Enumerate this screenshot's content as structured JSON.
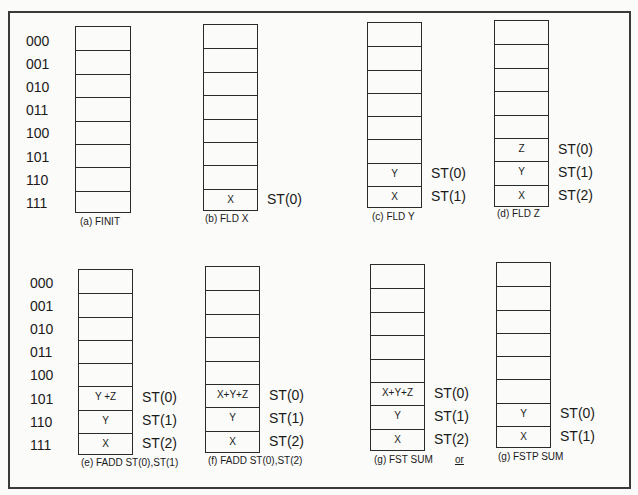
{
  "address_labels": {
    "top": [
      "000",
      "001",
      "010",
      "011",
      "100",
      "101",
      "110",
      "111"
    ],
    "bottom": [
      "000",
      "001",
      "010",
      "011",
      "100",
      "101",
      "110",
      "111"
    ]
  },
  "stacks": [
    {
      "id": "a",
      "caption": "(a) FINIT",
      "cells": [
        "",
        "",
        "",
        "",
        "",
        "",
        "",
        ""
      ],
      "st_labels": [
        "",
        "",
        "",
        "",
        "",
        "",
        "",
        ""
      ]
    },
    {
      "id": "b",
      "caption": "(b) FLD X",
      "cells": [
        "",
        "",
        "",
        "",
        "",
        "",
        "",
        "X"
      ],
      "st_labels": [
        "",
        "",
        "",
        "",
        "",
        "",
        "",
        "ST(0)"
      ]
    },
    {
      "id": "c",
      "caption": "(c) FLD Y",
      "cells": [
        "",
        "",
        "",
        "",
        "",
        "",
        "Y",
        "X"
      ],
      "st_labels": [
        "",
        "",
        "",
        "",
        "",
        "",
        "ST(0)",
        "ST(1)"
      ]
    },
    {
      "id": "d",
      "caption": "(d) FLD Z",
      "cells": [
        "",
        "",
        "",
        "",
        "",
        "Z",
        "Y",
        "X"
      ],
      "st_labels": [
        "",
        "",
        "",
        "",
        "",
        "ST(0)",
        "ST(1)",
        "ST(2)"
      ]
    },
    {
      "id": "e",
      "caption": "(e) FADD ST(0),ST(1)",
      "cells": [
        "",
        "",
        "",
        "",
        "",
        "Y +Z",
        "Y",
        "X"
      ],
      "st_labels": [
        "",
        "",
        "",
        "",
        "",
        "ST(0)",
        "ST(1)",
        "ST(2)"
      ]
    },
    {
      "id": "f",
      "caption": "(f) FADD ST(0),ST(2)",
      "cells": [
        "",
        "",
        "",
        "",
        "",
        "X+Y+Z",
        "Y",
        "X"
      ],
      "st_labels": [
        "",
        "",
        "",
        "",
        "",
        "ST(0)",
        "ST(1)",
        "ST(2)"
      ]
    },
    {
      "id": "g1",
      "caption": "(g) FST SUM",
      "cells": [
        "",
        "",
        "",
        "",
        "",
        "X+Y+Z",
        "Y",
        "X"
      ],
      "st_labels": [
        "",
        "",
        "",
        "",
        "",
        "ST(0)",
        "ST(1)",
        "ST(2)"
      ]
    },
    {
      "id": "g2",
      "caption": "(g) FSTP SUM",
      "cells": [
        "",
        "",
        "",
        "",
        "",
        "",
        "Y",
        "X"
      ],
      "st_labels": [
        "",
        "",
        "",
        "",
        "",
        "",
        "ST(0)",
        "ST(1)"
      ]
    }
  ],
  "connector_text": "or"
}
